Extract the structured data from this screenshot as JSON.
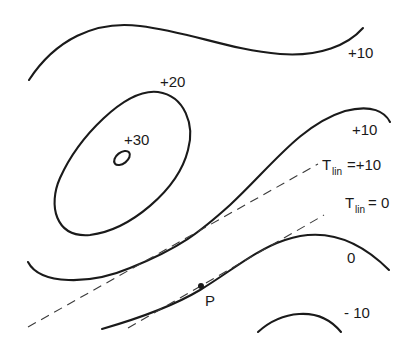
{
  "diagram": {
    "type": "contour-map",
    "contours": [
      {
        "id": "contour-top-plus10",
        "label": "+10"
      },
      {
        "id": "contour-plus20",
        "label": "+20"
      },
      {
        "id": "contour-plus30",
        "label": "+30"
      },
      {
        "id": "contour-right-plus10",
        "label": "+10"
      },
      {
        "id": "contour-zero",
        "label": "0"
      },
      {
        "id": "contour-minus10",
        "label": "- 10"
      }
    ],
    "tangent_lines": [
      {
        "id": "tlin-plus10",
        "symbol": "T",
        "subscript": "lin",
        "value": "=+10"
      },
      {
        "id": "tlin-zero",
        "symbol": "T",
        "subscript": "lin",
        "value": "= 0"
      }
    ],
    "point": {
      "label": "P"
    }
  }
}
